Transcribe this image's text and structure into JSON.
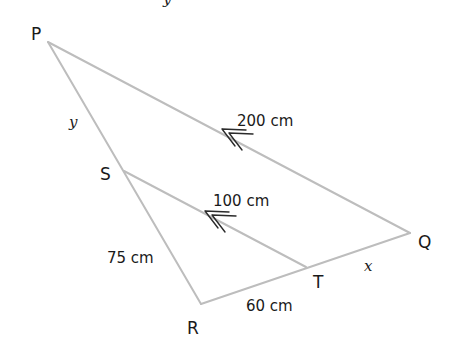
{
  "diagram": {
    "title_cropped": "y",
    "colors": {
      "edge": "#bdbdbd",
      "arrow": "#2a2a2a",
      "text": "#1a1a1a",
      "background": "#ffffff"
    },
    "vertices": {
      "P": {
        "label": "P",
        "x": 48,
        "y": 42
      },
      "Q": {
        "label": "Q",
        "x": 410,
        "y": 233
      },
      "R": {
        "label": "R",
        "x": 201,
        "y": 304
      },
      "S": {
        "label": "S",
        "x": 124,
        "y": 171
      },
      "T": {
        "label": "T",
        "x": 306,
        "y": 267
      }
    },
    "edges": [
      {
        "from": "P",
        "to": "Q",
        "measure": "200 cm",
        "parallel_mark": "double-arrow"
      },
      {
        "from": "S",
        "to": "T",
        "measure": "100 cm",
        "parallel_mark": "double-arrow"
      },
      {
        "from": "P",
        "to": "S",
        "measure": "y"
      },
      {
        "from": "S",
        "to": "R",
        "measure": "75 cm"
      },
      {
        "from": "R",
        "to": "T",
        "measure": "60 cm"
      },
      {
        "from": "T",
        "to": "Q",
        "measure": "x"
      }
    ],
    "labels": {
      "pq": "200 cm",
      "st": "100 cm",
      "sr": "75 cm",
      "rt": "60 cm",
      "ps": "y",
      "tq": "x"
    }
  }
}
